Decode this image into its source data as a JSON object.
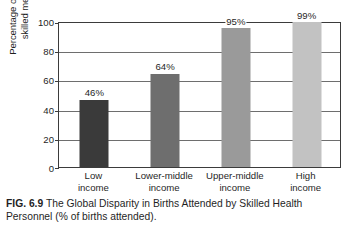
{
  "chart_data": {
    "type": "bar",
    "title": "",
    "categories": [
      "Low\nincome",
      "Lower-middle\nincome",
      "Upper-middle\nincome",
      "High\nincome"
    ],
    "category_lines": [
      [
        "Low",
        "income"
      ],
      [
        "Lower-middle",
        "income"
      ],
      [
        "Upper-middle",
        "income"
      ],
      [
        "High",
        "income"
      ]
    ],
    "values": [
      46,
      64,
      95,
      99
    ],
    "value_labels": [
      "46%",
      "64%",
      "95%",
      "99%"
    ],
    "bar_colors": [
      "#3a3a3a",
      "#6e6e6e",
      "#9a9a9a",
      "#c2c2c2"
    ],
    "xlabel": "",
    "ylabel": "Percentage of births attended by skilled medical personnel",
    "ylabel_lines": [
      "Percentage of births attended by",
      "skilled medical personnel"
    ],
    "ylim": [
      0,
      100
    ],
    "yticks": [
      0,
      20,
      40,
      60,
      80,
      100
    ],
    "ytick_labels": [
      "0",
      "20",
      "40",
      "60",
      "80",
      "100"
    ],
    "grid": true,
    "grid_axis": "y",
    "legend": false,
    "legend_position": "none"
  },
  "caption": {
    "tag": "FIG. 6.9",
    "text": "The Global Disparity in Births Attended by Skilled Health Personnel (% of births attended)."
  }
}
